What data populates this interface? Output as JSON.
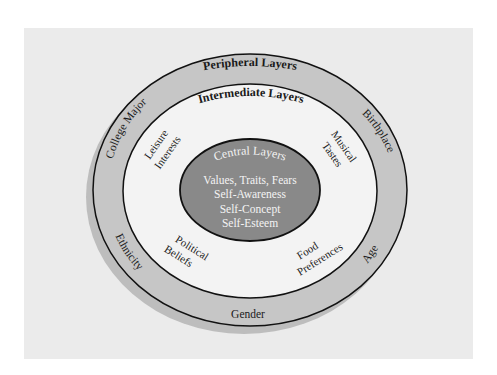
{
  "diagram": {
    "type": "concentric-layers",
    "colors": {
      "page_background": "#ffffff",
      "panel_background": "#ebebeb",
      "peripheral_fill": "#c6c6c6",
      "intermediate_fill": "#f3f3f3",
      "central_fill": "#898989",
      "stroke": "#111111",
      "shadow": "#bdbdbd"
    },
    "peripheral": {
      "title": "Peripheral Layers",
      "items": [
        "College Major",
        "Birthplace",
        "Ethnicity",
        "Age",
        "Gender"
      ]
    },
    "intermediate": {
      "title": "Intermediate Layers",
      "items": [
        {
          "line1": "Leisure",
          "line2": "Interests"
        },
        {
          "line1": "Musical",
          "line2": "Tastes"
        },
        {
          "line1": "Political",
          "line2": "Beliefs"
        },
        {
          "line1": "Food",
          "line2": "Preferences"
        }
      ]
    },
    "central": {
      "title": "Central Layers",
      "items": [
        "Values, Traits, Fears",
        "Self-Awareness",
        "Self-Concept",
        "Self-Esteem"
      ]
    }
  }
}
